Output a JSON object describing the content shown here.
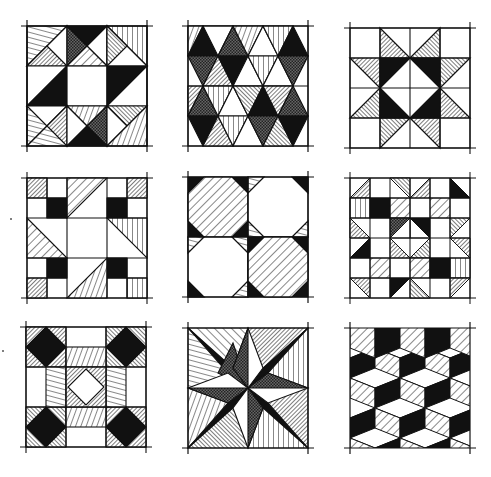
{
  "figure": {
    "background": "#ffffff",
    "ink": "#111111",
    "blocks": [
      {
        "id": "b1",
        "name": "Shoo-fly variant with pinwheels",
        "row": 1,
        "col": 1
      },
      {
        "id": "b2",
        "name": "Diamond and triangle rows",
        "row": 1,
        "col": 2
      },
      {
        "id": "b3",
        "name": "Eight-pointed star",
        "row": 1,
        "col": 3
      },
      {
        "id": "b4",
        "name": "Nine-patch with triangles",
        "row": 2,
        "col": 1
      },
      {
        "id": "b5",
        "name": "Octagon snowball",
        "row": 2,
        "col": 2
      },
      {
        "id": "b6",
        "name": "Checkerboard of half-square triangles",
        "row": 2,
        "col": 3
      },
      {
        "id": "b7",
        "name": "Square-in-a-square grid",
        "row": 3,
        "col": 1
      },
      {
        "id": "b8",
        "name": "Mariner's compass star",
        "row": 3,
        "col": 2
      },
      {
        "id": "b9",
        "name": "Tumbling blocks",
        "row": 3,
        "col": 3
      }
    ]
  }
}
